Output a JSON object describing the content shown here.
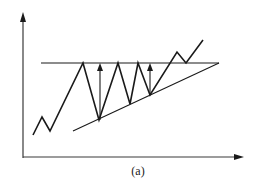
{
  "diagram": {
    "caption": "(a)",
    "colors": {
      "line": "#1a1a1a",
      "axis": "#3a3a3a",
      "background": "#ffffff"
    },
    "axes": {
      "y_axis": {
        "x": 23,
        "y_bottom": 158,
        "y_top": 12
      },
      "x_axis": {
        "y": 157,
        "x_left": 23,
        "x_right": 244
      }
    },
    "resistance_line": {
      "x1": 41,
      "y1": 63,
      "x2": 219,
      "y2": 63
    },
    "support_line": {
      "x1": 73,
      "y1": 131,
      "x2": 219,
      "y2": 63
    },
    "price_path": [
      [
        33,
        135
      ],
      [
        42,
        117
      ],
      [
        50,
        131
      ],
      [
        83,
        63
      ],
      [
        99,
        120
      ],
      [
        118,
        63
      ],
      [
        130,
        104
      ],
      [
        138,
        63
      ],
      [
        150,
        95
      ],
      [
        177,
        52
      ],
      [
        186,
        63
      ],
      [
        203,
        40
      ]
    ],
    "measure_arrows": [
      {
        "x": 100,
        "y_from": 120,
        "y_to": 64
      },
      {
        "x": 150,
        "y_from": 95,
        "y_to": 64
      }
    ]
  }
}
